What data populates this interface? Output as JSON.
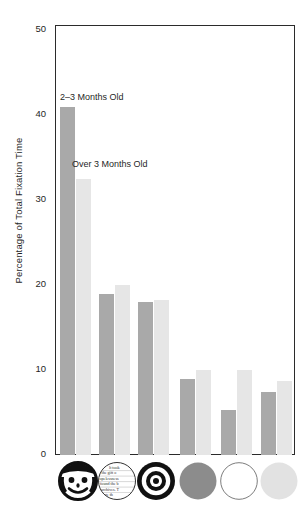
{
  "chart_data": {
    "type": "bar",
    "title": "",
    "subtitle": "",
    "xlabel": "",
    "ylabel": "Percentage of Total Fixation Time",
    "ylim": [
      0,
      52
    ],
    "yticks": [
      0,
      10,
      20,
      30,
      40,
      50
    ],
    "ytick_labels": [
      "0",
      "10",
      "20",
      "30",
      "40",
      "50"
    ],
    "grid": false,
    "legend_position": "inline-annotation",
    "categories": [
      "Face",
      "Newsprint",
      "Bullseye",
      "Red circle",
      "White circle",
      "Yellow circle"
    ],
    "category_icons": [
      "smiley-face-icon",
      "newsprint-icon",
      "bullseye-icon",
      "red-circle-icon",
      "white-circle-icon",
      "yellow-circle-icon"
    ],
    "series": [
      {
        "name": "2–3 Months Old",
        "color": "#a9a9a9",
        "values": [
          41.0,
          19.0,
          18.0,
          9.0,
          5.3,
          7.4
        ]
      },
      {
        "name": "Over 3 Months Old",
        "color": "#e6e6e6",
        "values": [
          32.5,
          20.0,
          18.2,
          10.0,
          10.0,
          8.7
        ]
      }
    ],
    "annotations": [
      {
        "text": "2–3 Months Old",
        "series": 0
      },
      {
        "text": "Over 3 Months Old",
        "series": 1
      }
    ]
  },
  "axis": {
    "y_title": "Percentage of Total Fixation Time",
    "tick_50": "50",
    "tick_40": "40",
    "tick_30": "30",
    "tick_20": "20",
    "tick_10": "10",
    "tick_0": "0"
  },
  "annotations": {
    "series_0_label": "2–3 Months Old",
    "series_1_label": "Over 3 Months Old"
  },
  "icons": {
    "newsprint_lines": [
      "the gift o",
      "opelessness",
      "found the b",
      "archives."
    ]
  },
  "colors": {
    "series_0": "#a9a9a9",
    "series_1": "#e6e6e6",
    "frame": "#2b2b2b",
    "text": "#1f1f1f",
    "red_circle": "#8c8c8c",
    "yellow_circle": "#e2e2e2",
    "white_circle": "#ffffff"
  }
}
